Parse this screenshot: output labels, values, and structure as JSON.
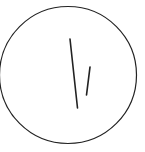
{
  "canvas": {
    "width": 145,
    "height": 152,
    "background_color": "#ffffff",
    "title": "line-drawing"
  },
  "style": {
    "stroke_color": "#222222",
    "circle_stroke_width": 1.2,
    "line_stroke_width": 1.6
  },
  "shapes": {
    "circle": {
      "name": "outer-circle",
      "cx": 68,
      "cy": 75,
      "r": 68.5
    },
    "long_line": {
      "name": "long-stroke",
      "x1": 70,
      "y1": 39,
      "x2": 77.5,
      "y2": 108
    },
    "short_line": {
      "name": "short-stroke",
      "x1": 90,
      "y1": 67,
      "x2": 86.5,
      "y2": 95
    }
  }
}
